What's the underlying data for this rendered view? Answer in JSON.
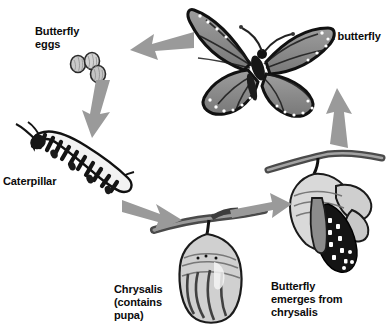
{
  "diagram": {
    "background_color": "#ffffff",
    "text_color": "#0b0b0b",
    "arrow_color": "#9a9a9a",
    "stages": [
      {
        "id": "eggs",
        "label": "Butterfly\neggs",
        "icon": "butterfly-eggs-illustration",
        "count": 3
      },
      {
        "id": "caterpillar",
        "label": "Caterpillar",
        "icon": "caterpillar-illustration"
      },
      {
        "id": "chrysalis",
        "label": "Chrysalis\n(contains\npupa)",
        "icon": "chrysalis-illustration"
      },
      {
        "id": "emerging",
        "label": "Butterfly\nemerges from\nchrysalis",
        "icon": "emerging-butterfly-illustration"
      },
      {
        "id": "adult",
        "label": "Adult butterfly",
        "icon": "monarch-butterfly-illustration"
      }
    ],
    "arrows": [
      {
        "id": "adult-to-eggs",
        "from": "adult",
        "to": "eggs",
        "direction": "left"
      },
      {
        "id": "eggs-to-caterpillar",
        "from": "eggs",
        "to": "caterpillar",
        "direction": "down-left"
      },
      {
        "id": "caterpillar-to-chrysalis",
        "from": "caterpillar",
        "to": "chrysalis",
        "direction": "down-right"
      },
      {
        "id": "chrysalis-to-emerging",
        "from": "chrysalis",
        "to": "emerging",
        "direction": "right"
      },
      {
        "id": "emerging-to-adult",
        "from": "emerging",
        "to": "adult",
        "direction": "up"
      }
    ]
  }
}
